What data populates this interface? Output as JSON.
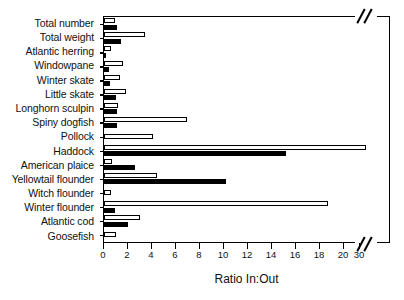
{
  "chart_data": {
    "type": "bar",
    "orientation": "horizontal",
    "title": "",
    "xlabel": "Ratio In:Out",
    "ylabel": "",
    "xlim": [
      0,
      32
    ],
    "grid": false,
    "legend": false,
    "axis_break": {
      "after": 20,
      "resume": 30
    },
    "xticks": [
      0,
      2,
      4,
      6,
      8,
      10,
      12,
      14,
      16,
      18,
      20,
      30
    ],
    "xticklabels": [
      "0",
      "2",
      "4",
      "6",
      "8",
      "10",
      "12",
      "14",
      "16",
      "18",
      "20",
      "30"
    ],
    "categories": [
      "Total number",
      "Total weight",
      "Atlantic herring",
      "Windowpane",
      "Winter skate",
      "Little skate",
      "Longhorn sculpin",
      "Spiny dogfish",
      "Pollock",
      "Haddock",
      "American plaice",
      "Yellowtail flounder",
      "Witch flounder",
      "Winter flounder",
      "Atlantic cod",
      "Goosefish"
    ],
    "series": [
      {
        "name": "open-bar",
        "color": "#ffffff",
        "values": [
          0.9,
          3.4,
          0.6,
          1.6,
          1.3,
          1.8,
          1.2,
          6.9,
          4.1,
          31.0,
          0.7,
          4.4,
          0.6,
          18.7,
          3.0,
          1.0
        ]
      },
      {
        "name": "filled-bar",
        "color": "#000000",
        "values": [
          1.1,
          1.4,
          0.1,
          0.4,
          0.5,
          1.0,
          1.1,
          1.1,
          0.0,
          15.2,
          2.6,
          10.2,
          0.0,
          0.9,
          2.0,
          0.0
        ]
      }
    ]
  }
}
